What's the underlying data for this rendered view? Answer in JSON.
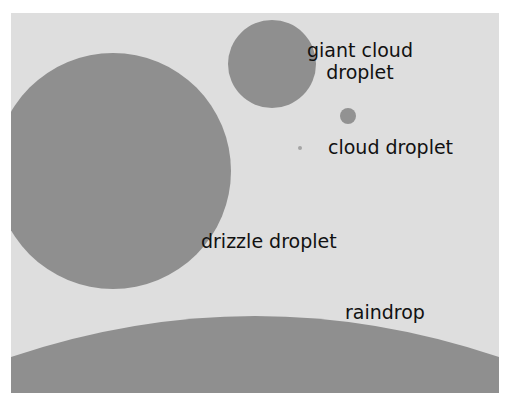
{
  "diagram": {
    "background_color": "#dedede",
    "droplet_color": "#8f8f8f",
    "items": [
      {
        "id": "raindrop",
        "label": "raindrop"
      },
      {
        "id": "drizzle",
        "label": "drizzle droplet"
      },
      {
        "id": "giant_cloud",
        "label_line1": "giant cloud",
        "label_line2": "droplet"
      },
      {
        "id": "cloud",
        "label": "cloud droplet"
      }
    ]
  }
}
